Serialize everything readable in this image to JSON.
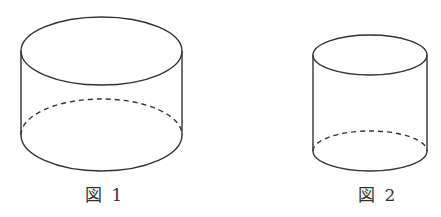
{
  "figures": [
    {
      "id": "fig1",
      "caption": "図 1",
      "shape": "cylinder",
      "proportion": "wide-short",
      "geometry": {
        "cx": 101.5,
        "rx": 80.5,
        "top_cy": 51,
        "top_ry": 34,
        "bottom_cy": 135,
        "bottom_ry": 36
      }
    },
    {
      "id": "fig2",
      "caption": "図 2",
      "shape": "cylinder",
      "proportion": "narrow-tall",
      "geometry": {
        "cx": 370,
        "rx": 57,
        "top_cy": 55,
        "top_ry": 20,
        "bottom_cy": 151,
        "bottom_ry": 20
      }
    }
  ],
  "style": {
    "stroke_color": "#333333",
    "hidden_edge": "dashed"
  }
}
